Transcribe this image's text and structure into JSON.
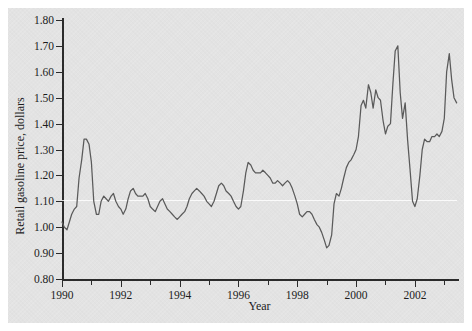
{
  "chart_data": {
    "type": "line",
    "title": "",
    "xlabel": "Year",
    "ylabel": "Retail gasoline price, dollars",
    "xlim": [
      1990.0,
      2003.5
    ],
    "ylim": [
      0.8,
      1.8
    ],
    "grid": false,
    "legend": null,
    "y_ticks": [
      "0.80",
      "0.90",
      "1.00",
      "1.10",
      "1.20",
      "1.30",
      "1.40",
      "1.50",
      "1.60",
      "1.70",
      "1.80"
    ],
    "y_tick_values": [
      0.8,
      0.9,
      1.0,
      1.1,
      1.2,
      1.3,
      1.4,
      1.5,
      1.6,
      1.7,
      1.8
    ],
    "x_ticks": [
      "1990",
      "1992",
      "1994",
      "1996",
      "1998",
      "2000",
      "2002"
    ],
    "x_tick_values": [
      1990,
      1992,
      1994,
      1996,
      1998,
      2000,
      2002
    ],
    "x_minor_ticks": [
      1991,
      1993,
      1995,
      1997,
      1999,
      2001,
      2003
    ],
    "series": [
      {
        "name": "Retail gasoline price",
        "color": "#5a5a5a",
        "x": [
          1990.0,
          1990.08,
          1990.17,
          1990.25,
          1990.33,
          1990.42,
          1990.5,
          1990.58,
          1990.67,
          1990.75,
          1990.83,
          1990.92,
          1991.0,
          1991.08,
          1991.17,
          1991.25,
          1991.33,
          1991.42,
          1991.5,
          1991.58,
          1991.67,
          1991.75,
          1991.83,
          1991.92,
          1992.0,
          1992.08,
          1992.17,
          1992.25,
          1992.33,
          1992.42,
          1992.5,
          1992.58,
          1992.67,
          1992.75,
          1992.83,
          1992.92,
          1993.0,
          1993.08,
          1993.17,
          1993.25,
          1993.33,
          1993.42,
          1993.5,
          1993.58,
          1993.67,
          1993.75,
          1993.83,
          1993.92,
          1994.0,
          1994.08,
          1994.17,
          1994.25,
          1994.33,
          1994.42,
          1994.5,
          1994.58,
          1994.67,
          1994.75,
          1994.83,
          1994.92,
          1995.0,
          1995.08,
          1995.17,
          1995.25,
          1995.33,
          1995.42,
          1995.5,
          1995.58,
          1995.67,
          1995.75,
          1995.83,
          1995.92,
          1996.0,
          1996.08,
          1996.17,
          1996.25,
          1996.33,
          1996.42,
          1996.5,
          1996.58,
          1996.67,
          1996.75,
          1996.83,
          1996.92,
          1997.0,
          1997.08,
          1997.17,
          1997.25,
          1997.33,
          1997.42,
          1997.5,
          1997.58,
          1997.67,
          1997.75,
          1997.83,
          1997.92,
          1998.0,
          1998.08,
          1998.17,
          1998.25,
          1998.33,
          1998.42,
          1998.5,
          1998.58,
          1998.67,
          1998.75,
          1998.83,
          1998.92,
          1999.0,
          1999.08,
          1999.17,
          1999.25,
          1999.33,
          1999.42,
          1999.5,
          1999.58,
          1999.67,
          1999.75,
          1999.83,
          1999.92,
          2000.0,
          2000.08,
          2000.17,
          2000.25,
          2000.33,
          2000.42,
          2000.5,
          2000.58,
          2000.67,
          2000.75,
          2000.83,
          2000.92,
          2001.0,
          2001.08,
          2001.17,
          2001.25,
          2001.33,
          2001.42,
          2001.5,
          2001.58,
          2001.67,
          2001.75,
          2001.83,
          2001.92,
          2002.0,
          2002.08,
          2002.17,
          2002.25,
          2002.33,
          2002.42,
          2002.5,
          2002.58,
          2002.67,
          2002.75,
          2002.83,
          2002.92,
          2003.0,
          2003.08,
          2003.17,
          2003.25,
          2003.33,
          2003.42
        ],
        "y": [
          1.02,
          1.0,
          0.99,
          1.02,
          1.05,
          1.07,
          1.08,
          1.19,
          1.26,
          1.34,
          1.34,
          1.32,
          1.25,
          1.1,
          1.05,
          1.05,
          1.1,
          1.12,
          1.11,
          1.1,
          1.12,
          1.13,
          1.1,
          1.08,
          1.07,
          1.05,
          1.07,
          1.11,
          1.14,
          1.15,
          1.13,
          1.12,
          1.12,
          1.12,
          1.13,
          1.11,
          1.08,
          1.07,
          1.06,
          1.08,
          1.1,
          1.11,
          1.09,
          1.07,
          1.06,
          1.05,
          1.04,
          1.03,
          1.04,
          1.05,
          1.06,
          1.08,
          1.11,
          1.13,
          1.14,
          1.15,
          1.14,
          1.13,
          1.12,
          1.1,
          1.09,
          1.08,
          1.1,
          1.13,
          1.16,
          1.17,
          1.16,
          1.14,
          1.13,
          1.12,
          1.1,
          1.08,
          1.07,
          1.08,
          1.14,
          1.21,
          1.25,
          1.24,
          1.22,
          1.21,
          1.21,
          1.21,
          1.22,
          1.21,
          1.2,
          1.19,
          1.17,
          1.17,
          1.18,
          1.17,
          1.16,
          1.17,
          1.18,
          1.17,
          1.15,
          1.12,
          1.09,
          1.05,
          1.04,
          1.05,
          1.06,
          1.06,
          1.05,
          1.03,
          1.01,
          1.0,
          0.98,
          0.95,
          0.92,
          0.93,
          0.97,
          1.09,
          1.13,
          1.12,
          1.15,
          1.19,
          1.23,
          1.25,
          1.26,
          1.28,
          1.3,
          1.35,
          1.47,
          1.49,
          1.46,
          1.55,
          1.52,
          1.46,
          1.53,
          1.5,
          1.49,
          1.41,
          1.36,
          1.39,
          1.4,
          1.55,
          1.68,
          1.7,
          1.52,
          1.42,
          1.48,
          1.34,
          1.23,
          1.1,
          1.08,
          1.11,
          1.2,
          1.3,
          1.34,
          1.33,
          1.33,
          1.35,
          1.35,
          1.36,
          1.35,
          1.37,
          1.42,
          1.6,
          1.67,
          1.57,
          1.5,
          1.48
        ]
      }
    ]
  },
  "annotations": {
    "reflection_highlight_value": 1.105
  }
}
